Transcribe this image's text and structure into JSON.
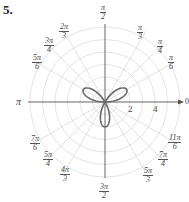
{
  "problem_number": "5.",
  "chart_data": {
    "type": "polar",
    "title": "",
    "equation_plotted": "r = 2 sin 3θ",
    "curve": {
      "kind": "three-petal rose",
      "amplitude": 2,
      "k": 3,
      "petal_angles": [
        "π/6",
        "5π/6",
        "3π/2"
      ]
    },
    "radial_ticks": [
      "2",
      "4"
    ],
    "radial_range": [
      0,
      6
    ],
    "grid": {
      "circles": [
        1,
        2,
        3,
        4,
        5,
        6
      ],
      "spokes_every": "π/12 style labeled angles"
    },
    "angle_labels": [
      {
        "key": "a0",
        "text": "0"
      },
      {
        "key": "a30",
        "num": "π",
        "den": "6"
      },
      {
        "key": "a45",
        "num": "π",
        "den": "4"
      },
      {
        "key": "a60",
        "num": "π",
        "den": "3"
      },
      {
        "key": "a90",
        "num": "π",
        "den": "2"
      },
      {
        "key": "a120",
        "num": "2π",
        "den": "3"
      },
      {
        "key": "a135",
        "num": "3π",
        "den": "4"
      },
      {
        "key": "a150",
        "num": "5π",
        "den": "6"
      },
      {
        "key": "a180",
        "text": "π"
      },
      {
        "key": "a210",
        "num": "7π",
        "den": "6"
      },
      {
        "key": "a225",
        "num": "5π",
        "den": "4"
      },
      {
        "key": "a240",
        "num": "4π",
        "den": "3"
      },
      {
        "key": "a270",
        "num": "3π",
        "den": "2"
      },
      {
        "key": "a300",
        "num": "5π",
        "den": "3"
      },
      {
        "key": "a315",
        "num": "7π",
        "den": "4"
      },
      {
        "key": "a330",
        "num": "11π",
        "den": "6"
      }
    ],
    "colors": {
      "curve": "#666666",
      "grid": "#d8d8d8",
      "axis": "#555555"
    }
  },
  "labels": {
    "zero": "0",
    "pi": "π",
    "a30n": "π",
    "a30d": "6",
    "a45n": "π",
    "a45d": "4",
    "a60n": "π",
    "a60d": "3",
    "a90n": "π",
    "a90d": "2",
    "a120n": "2π",
    "a120d": "3",
    "a135n": "3π",
    "a135d": "4",
    "a150n": "5π",
    "a150d": "6",
    "a210n": "7π",
    "a210d": "6",
    "a225n": "5π",
    "a225d": "4",
    "a240n": "4π",
    "a240d": "3",
    "a270n": "3π",
    "a270d": "2",
    "a300n": "5π",
    "a300d": "3",
    "a315n": "7π",
    "a315d": "4",
    "a330n": "11π",
    "a330d": "6",
    "tick2": "2",
    "tick4": "4"
  }
}
